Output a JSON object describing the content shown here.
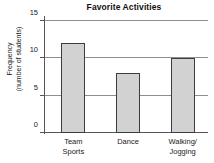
{
  "chart_data": {
    "type": "bar",
    "title": "Favorite Activities",
    "xlabel": "",
    "ylabel": "Frequency (number of students)",
    "ylabel_lines": [
      "Frequency",
      "(number of students)"
    ],
    "categories": [
      "Team Sports",
      "Dance",
      "Walking/ Jogging"
    ],
    "category_lines": [
      [
        "Team",
        "Sports"
      ],
      [
        "Dance"
      ],
      [
        "Walking/",
        "Jogging"
      ]
    ],
    "values": [
      12,
      8,
      10
    ],
    "ylim": [
      0,
      15
    ],
    "yticks": [
      0,
      5,
      10,
      15
    ],
    "ytick_labels": [
      "0",
      "5",
      "10",
      "15"
    ],
    "grid": true,
    "grid_axis": "y",
    "legend": false,
    "colors": {
      "bar_fill": "#d2d2d2",
      "bar_edge": "#3d3d3d",
      "grid": "#8e8e8e",
      "axis": "#565656",
      "text": "#1a1a1a",
      "background": "#ffffff"
    }
  }
}
